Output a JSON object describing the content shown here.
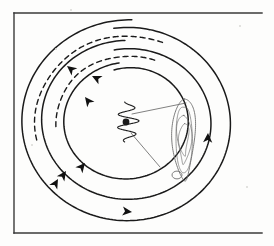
{
  "figure": {
    "title": "Hand-drawn spiral orbit diagram",
    "medium": "ink-on-paper scan",
    "ink_color": "#1a1a1a",
    "paper_color": "#fdfdfc",
    "width": 274,
    "height": 246
  },
  "frame": {
    "label": "figure border",
    "stroke": "#3a3a3a",
    "stroke_width": 1.4,
    "left": 14,
    "top": 13,
    "right": 262,
    "bottom": 233,
    "sides_drawn": [
      "left",
      "top",
      "bottom"
    ],
    "right_side_drawn": false
  },
  "chart_data": {
    "type": "scatter",
    "title": "Hand-drawn spiral orbit diagram",
    "xlabel": "",
    "ylabel": "",
    "xlim": [
      14,
      262
    ],
    "ylim": [
      13,
      233
    ],
    "grid": false,
    "legend": "none",
    "center": {
      "x": 128,
      "y": 122,
      "label": "central coil"
    },
    "annotations": [
      "three concentric spiral tracks circulating clockwise",
      "two dashed companion arcs in the upper-left quadrant",
      "small coiled spring glyph at the centre",
      "two thin radial lines from centre toward the right",
      "elongated outlined lobe on the right side"
    ],
    "series": [
      {
        "name": "outer spiral track",
        "style": "solid",
        "stroke": "#1a1a1a",
        "stroke_width": 1.5,
        "radius_x": 101,
        "radius_y": 94,
        "start_angle_deg": -98,
        "end_angle_deg": 272,
        "drift": 8
      },
      {
        "name": "middle spiral track",
        "style": "solid",
        "stroke": "#1a1a1a",
        "stroke_width": 1.5,
        "radius_x": 80,
        "radius_y": 74,
        "start_angle_deg": -100,
        "end_angle_deg": 268,
        "drift": 8
      },
      {
        "name": "inner spiral track",
        "style": "solid",
        "stroke": "#1a1a1a",
        "stroke_width": 1.5,
        "radius_x": 58,
        "radius_y": 54,
        "start_angle_deg": -104,
        "end_angle_deg": 262,
        "drift": 7
      },
      {
        "name": "outer dashed companion arc",
        "style": "dashed",
        "stroke": "#1a1a1a",
        "stroke_width": 1.4,
        "dash_pattern": "5,4",
        "radius_x": 93,
        "radius_y": 86,
        "start_angle_deg": 168,
        "end_angle_deg": 292
      },
      {
        "name": "inner dashed companion arc",
        "style": "dashed",
        "stroke": "#1a1a1a",
        "stroke_width": 1.4,
        "dash_pattern": "5,4",
        "radius_x": 72,
        "radius_y": 66,
        "start_angle_deg": 176,
        "end_angle_deg": 292
      }
    ],
    "arrowheads": [
      {
        "id": 1,
        "name": "outer-dashed-arrow",
        "x": 67,
        "y": 66,
        "rotation_deg": 218,
        "on": "outer dashed companion arc"
      },
      {
        "id": 2,
        "name": "inner-dashed-arrow",
        "x": 92,
        "y": 76,
        "rotation_deg": 206,
        "on": "inner dashed companion arc"
      },
      {
        "id": 3,
        "name": "inner-upper-arrow",
        "x": 85,
        "y": 97,
        "rotation_deg": 232,
        "on": "inner spiral track"
      },
      {
        "id": 4,
        "name": "inner-lower-arrow",
        "x": 85,
        "y": 163,
        "rotation_deg": 310,
        "on": "inner spiral track"
      },
      {
        "id": 5,
        "name": "middle-lower-arrow",
        "x": 66,
        "y": 171,
        "rotation_deg": 305,
        "on": "middle spiral track"
      },
      {
        "id": 6,
        "name": "outer-left-arrow",
        "x": 58,
        "y": 179,
        "rotation_deg": 300,
        "on": "outer spiral track"
      },
      {
        "id": 7,
        "name": "outer-bottom-arrow",
        "x": 132,
        "y": 212,
        "rotation_deg": 6,
        "on": "outer spiral track"
      },
      {
        "id": 8,
        "name": "outer-right-arrow",
        "x": 208,
        "y": 133,
        "rotation_deg": 272,
        "on": "outer spiral track"
      }
    ],
    "central_coil": {
      "name": "central coil glyph",
      "x": 128,
      "y": 122,
      "width": 22,
      "height": 40,
      "turns": 3
    },
    "radial_lines": [
      {
        "name": "upper radial line",
        "x1": 132,
        "y1": 114,
        "x2": 186,
        "y2": 103,
        "stroke_width": 0.7
      },
      {
        "name": "lower radial line",
        "x1": 131,
        "y1": 133,
        "x2": 160,
        "y2": 167,
        "stroke_width": 0.7
      }
    ],
    "lobe": {
      "name": "elongated outlined lobe",
      "x_range": [
        171,
        197
      ],
      "y_range": [
        99,
        181
      ],
      "stroke": "#6e6e6e",
      "stroke_width": 0.9,
      "fill": "none",
      "inner_contours": 3,
      "tail_loop": {
        "x": 177,
        "y": 175,
        "r": 5
      }
    }
  },
  "speckles": [
    {
      "x": 70,
      "y": 9,
      "size": 2
    },
    {
      "x": 55,
      "y": 48,
      "size": 2
    },
    {
      "x": 31,
      "y": 144,
      "size": 2
    },
    {
      "x": 246,
      "y": 186,
      "size": 2
    },
    {
      "x": 239,
      "y": 25,
      "size": 2
    }
  ]
}
